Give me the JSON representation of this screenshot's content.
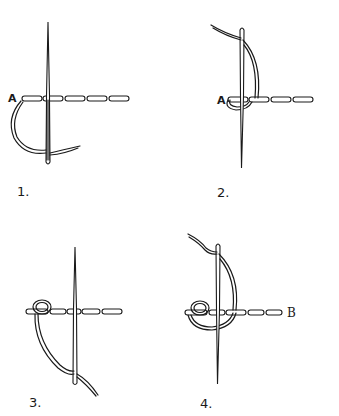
{
  "ink_color": "#1a1a1a",
  "background_color": "#ffffff",
  "panels": [
    {
      "step_label": "1.",
      "point_labels": [
        "A"
      ]
    },
    {
      "step_label": "2.",
      "point_labels": [
        "A"
      ]
    },
    {
      "step_label": "3.",
      "point_labels": []
    },
    {
      "step_label": "4.",
      "point_labels": [
        "B"
      ]
    }
  ]
}
